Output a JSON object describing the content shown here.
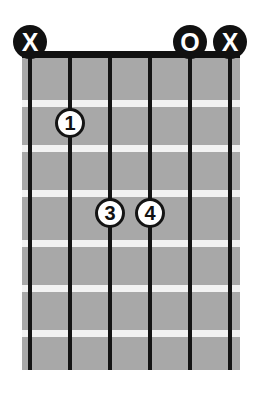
{
  "diagram": {
    "type": "guitar-chord-diagram",
    "strings_count": 6,
    "frets_count": 7,
    "colors": {
      "fretboard": "#a8a8a8",
      "string": "#141414",
      "nut": "#111111",
      "fret_line": "#f2f2f2",
      "marker_fill": "#111111",
      "marker_text": "#ffffff",
      "dot_fill": "#ffffff",
      "dot_text": "#111111",
      "background": "#ffffff"
    },
    "string_positions_px": [
      30,
      70,
      110,
      150,
      190,
      230
    ],
    "fret_line_positions_px": [
      100,
      145,
      190,
      240,
      285,
      330
    ],
    "nut_y_px": 55,
    "board_bottom_px": 370
  },
  "top_markers": [
    {
      "symbol": "X",
      "name": "muted-string-marker",
      "string": 1,
      "x": 30
    },
    {
      "symbol": "O",
      "name": "open-string-marker",
      "string": 5,
      "x": 190
    },
    {
      "symbol": "X",
      "name": "muted-string-marker",
      "string": 6,
      "x": 230
    }
  ],
  "finger_dots": [
    {
      "label": "1",
      "string": 2,
      "fret": 2,
      "x": 70,
      "y": 123
    },
    {
      "label": "3",
      "string": 3,
      "fret": 4,
      "x": 110,
      "y": 213
    },
    {
      "label": "4",
      "string": 4,
      "fret": 4,
      "x": 150,
      "y": 213
    }
  ]
}
